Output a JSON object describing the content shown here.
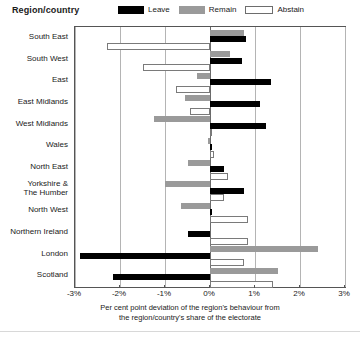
{
  "header": {
    "title": "Region/country",
    "legend": [
      {
        "key": "leave",
        "label": "Leave",
        "color": "#000000",
        "swatch": "filled-black-swatch"
      },
      {
        "key": "remain",
        "label": "Remain",
        "color": "#9a9a9a",
        "swatch": "filled-grey-swatch"
      },
      {
        "key": "abstain",
        "label": "Abstain",
        "color": "#ffffff",
        "swatch": "outlined-white-swatch"
      }
    ]
  },
  "axis": {
    "xlabel_line1": "Per cent point deviation of the region's behaviour from",
    "xlabel_line2": "the region/country's share of the electorate",
    "ticks": [
      "-3%",
      "-2%",
      "-1%",
      "0%",
      "1%",
      "2%",
      "3%"
    ]
  },
  "chart_data": {
    "type": "bar",
    "orientation": "horizontal",
    "title": "Region/country",
    "xlabel": "Per cent point deviation of the region's behaviour from the region/country's share of the electorate",
    "ylabel": "Region/country",
    "xlim": [
      -3,
      3
    ],
    "xticks": [
      -3,
      -2,
      -1,
      0,
      1,
      2,
      3
    ],
    "grid": true,
    "legend_position": "top",
    "categories": [
      "South East",
      "South West",
      "East",
      "East Midlands",
      "West Midlands",
      "Wales",
      "North East",
      "Yorkshire &\nThe Humber",
      "North West",
      "Northern Ireland",
      "London",
      "Scotland"
    ],
    "series": [
      {
        "name": "Leave",
        "color": "#000000",
        "values": [
          0.8,
          0.7,
          1.35,
          1.1,
          1.25,
          0.05,
          0.3,
          0.75,
          0.05,
          -0.5,
          -2.9,
          -2.15
        ]
      },
      {
        "name": "Remain",
        "color": "#9a9a9a",
        "values": [
          0.75,
          0.45,
          -0.3,
          -0.55,
          -1.25,
          -0.02,
          -0.5,
          -1.0,
          -0.65,
          0.0,
          2.4,
          1.5
        ]
      },
      {
        "name": "Abstain",
        "color": "#ffffff",
        "values": [
          -2.3,
          -1.5,
          -0.75,
          -0.45,
          0.05,
          0.08,
          0.4,
          0.3,
          0.85,
          0.85,
          0.75,
          1.4
        ]
      }
    ]
  }
}
